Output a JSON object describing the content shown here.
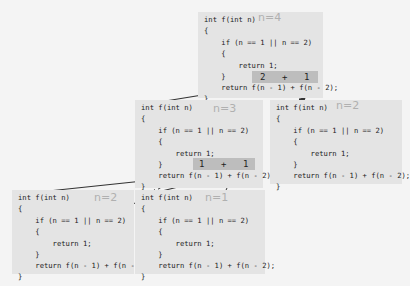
{
  "code_lines": [
    "int f(int n)",
    "{",
    "    if (n == 1 || n == 2)",
    "    {",
    "        return 1;",
    "    }",
    "    return f(n - 1) + f(n - 2);",
    "}"
  ],
  "boxes": [
    {
      "id": "f4",
      "label": "n=4"
    },
    {
      "id": "f3",
      "label": "n=3"
    },
    {
      "id": "f2_right",
      "label": "n=2"
    },
    {
      "id": "f2_left",
      "label": "n=2"
    },
    {
      "id": "f1",
      "label": "n=1"
    }
  ],
  "sums": [
    {
      "box": "f4",
      "left": "2",
      "op": "+",
      "right": "1"
    },
    {
      "box": "f3",
      "left": "1",
      "op": "+",
      "right": "1"
    }
  ],
  "colors": {
    "background": "#f4f4f4",
    "box": "#e4e4e4",
    "sum_bar": "#bdbdbd",
    "label": "#b0b0b0",
    "arrow": "#333333"
  }
}
